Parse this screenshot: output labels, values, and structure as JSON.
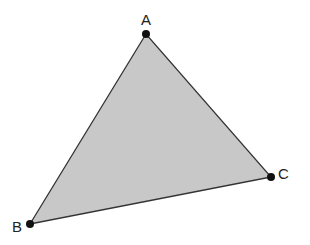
{
  "diagram": {
    "type": "triangle",
    "fill_color": "#c8c8c8",
    "stroke_color": "#333333",
    "vertices": [
      {
        "label": "A",
        "x": 146,
        "y": 34,
        "label_x": 141,
        "label_y": 25
      },
      {
        "label": "B",
        "x": 30,
        "y": 224,
        "label_x": 12,
        "label_y": 232
      },
      {
        "label": "C",
        "x": 271,
        "y": 177,
        "label_x": 278,
        "label_y": 179
      }
    ]
  }
}
